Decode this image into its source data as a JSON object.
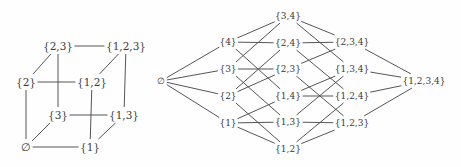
{
  "figure": {
    "background_color": "#fefefe",
    "edge_color": "#555555",
    "label_color": "#3a3a3a"
  },
  "chart_data": {
    "type": "diagram",
    "title": "",
    "subtitle": "",
    "xlabel": "",
    "ylabel": "",
    "diagrams": [
      {
        "name": "power-set-of-123",
        "node_count": 8,
        "nodes": [
          {
            "id": "n0",
            "label": "∅",
            "x": 26,
            "y": 147
          },
          {
            "id": "n1",
            "label": "{1}",
            "x": 90,
            "y": 147
          },
          {
            "id": "n2",
            "label": "{2}",
            "x": 26,
            "y": 82
          },
          {
            "id": "n3",
            "label": "{3}",
            "x": 58,
            "y": 115
          },
          {
            "id": "n12",
            "label": "{1,2}",
            "x": 92,
            "y": 82
          },
          {
            "id": "n13",
            "label": "{1,3}",
            "x": 124,
            "y": 115
          },
          {
            "id": "n23",
            "label": "{2,3}",
            "x": 58,
            "y": 46
          },
          {
            "id": "n123",
            "label": "{1,2,3}",
            "x": 126,
            "y": 46
          }
        ],
        "edges": [
          [
            "n0",
            "n1"
          ],
          [
            "n0",
            "n2"
          ],
          [
            "n0",
            "n3"
          ],
          [
            "n1",
            "n12"
          ],
          [
            "n1",
            "n13"
          ],
          [
            "n2",
            "n12"
          ],
          [
            "n2",
            "n23"
          ],
          [
            "n3",
            "n13"
          ],
          [
            "n3",
            "n23"
          ],
          [
            "n12",
            "n123"
          ],
          [
            "n13",
            "n123"
          ],
          [
            "n23",
            "n123"
          ]
        ]
      },
      {
        "name": "power-set-of-1234",
        "node_count": 16,
        "nodes": [
          {
            "id": "m0",
            "label": "∅",
            "x": 161,
            "y": 81
          },
          {
            "id": "m4",
            "label": "{4}",
            "x": 228,
            "y": 42
          },
          {
            "id": "m3",
            "label": "{3}",
            "x": 228,
            "y": 69
          },
          {
            "id": "m2",
            "label": "{2}",
            "x": 228,
            "y": 96
          },
          {
            "id": "m1",
            "label": "{1}",
            "x": 228,
            "y": 123
          },
          {
            "id": "m34",
            "label": "{3,4}",
            "x": 288,
            "y": 16
          },
          {
            "id": "m24",
            "label": "{2,4}",
            "x": 288,
            "y": 43
          },
          {
            "id": "m23",
            "label": "{2,3}",
            "x": 288,
            "y": 69
          },
          {
            "id": "m14",
            "label": "{1,4}",
            "x": 288,
            "y": 96
          },
          {
            "id": "m13",
            "label": "{1,3}",
            "x": 288,
            "y": 122
          },
          {
            "id": "m12",
            "label": "{1,2}",
            "x": 288,
            "y": 149
          },
          {
            "id": "m234",
            "label": "{2,3,4}",
            "x": 352,
            "y": 42
          },
          {
            "id": "m134",
            "label": "{1,3,4}",
            "x": 352,
            "y": 69
          },
          {
            "id": "m124",
            "label": "{1,2,4}",
            "x": 352,
            "y": 96
          },
          {
            "id": "m123",
            "label": "{1,2,3}",
            "x": 352,
            "y": 123
          },
          {
            "id": "m1234",
            "label": "{1,2,3,4}",
            "x": 424,
            "y": 81
          }
        ],
        "edges": [
          [
            "m0",
            "m4"
          ],
          [
            "m0",
            "m3"
          ],
          [
            "m0",
            "m2"
          ],
          [
            "m0",
            "m1"
          ],
          [
            "m4",
            "m34"
          ],
          [
            "m4",
            "m24"
          ],
          [
            "m4",
            "m14"
          ],
          [
            "m3",
            "m34"
          ],
          [
            "m3",
            "m23"
          ],
          [
            "m3",
            "m13"
          ],
          [
            "m2",
            "m24"
          ],
          [
            "m2",
            "m23"
          ],
          [
            "m2",
            "m12"
          ],
          [
            "m1",
            "m14"
          ],
          [
            "m1",
            "m13"
          ],
          [
            "m1",
            "m12"
          ],
          [
            "m34",
            "m234"
          ],
          [
            "m34",
            "m134"
          ],
          [
            "m24",
            "m234"
          ],
          [
            "m24",
            "m124"
          ],
          [
            "m23",
            "m234"
          ],
          [
            "m23",
            "m123"
          ],
          [
            "m14",
            "m134"
          ],
          [
            "m14",
            "m124"
          ],
          [
            "m13",
            "m134"
          ],
          [
            "m13",
            "m123"
          ],
          [
            "m12",
            "m124"
          ],
          [
            "m12",
            "m123"
          ],
          [
            "m234",
            "m1234"
          ],
          [
            "m134",
            "m1234"
          ],
          [
            "m124",
            "m1234"
          ],
          [
            "m123",
            "m1234"
          ]
        ]
      }
    ]
  }
}
